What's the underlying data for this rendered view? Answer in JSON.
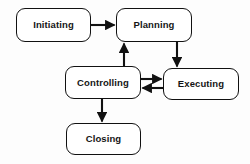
{
  "diagram": {
    "background_color": "#fdfdfd",
    "stroke_color": "#111111",
    "node_fill_color": "#ffffff",
    "nodes": [
      {
        "id": "initiating",
        "label": "Initiating",
        "x": 16,
        "y": 8,
        "w": 75,
        "h": 34
      },
      {
        "id": "planning",
        "label": "Planning",
        "x": 116,
        "y": 8,
        "w": 76,
        "h": 34
      },
      {
        "id": "controlling",
        "label": "Controlling",
        "x": 65,
        "y": 66,
        "w": 76,
        "h": 33
      },
      {
        "id": "executing",
        "label": "Executing",
        "x": 163,
        "y": 68,
        "w": 76,
        "h": 32
      },
      {
        "id": "closing",
        "label": "Closing",
        "x": 66,
        "y": 123,
        "w": 75,
        "h": 32
      }
    ],
    "edges": [
      {
        "id": "initiating-to-planning",
        "from": "initiating",
        "to": "planning",
        "direction": "right"
      },
      {
        "id": "planning-to-executing",
        "from": "planning",
        "to": "executing",
        "direction": "down"
      },
      {
        "id": "controlling-to-planning",
        "from": "controlling",
        "to": "planning",
        "direction": "up"
      },
      {
        "id": "controlling-to-executing",
        "from": "controlling",
        "to": "executing",
        "direction": "right"
      },
      {
        "id": "executing-to-controlling",
        "from": "executing",
        "to": "controlling",
        "direction": "left"
      },
      {
        "id": "controlling-to-closing",
        "from": "controlling",
        "to": "closing",
        "direction": "down"
      }
    ]
  }
}
